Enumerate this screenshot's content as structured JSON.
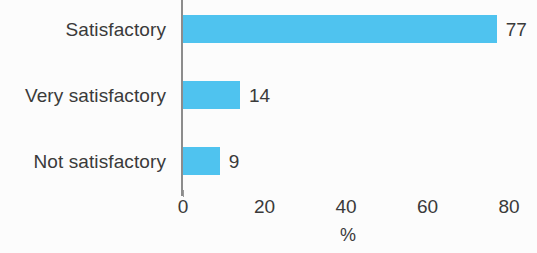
{
  "chart_data": {
    "type": "bar",
    "orientation": "horizontal",
    "title": "",
    "subtitle": "",
    "categories": [
      "Satisfactory",
      "Very satisfactory",
      "Not satisfactory"
    ],
    "values": [
      77,
      14,
      9
    ],
    "value_labels": [
      "77",
      "14",
      "9"
    ],
    "xlabel": "%",
    "ylabel": "",
    "xlim": [
      0,
      82
    ],
    "xticks": [
      0,
      20,
      40,
      60,
      80
    ],
    "xtick_labels": [
      "0",
      "20",
      "40",
      "60",
      "80"
    ],
    "grid": false,
    "legend": null,
    "bar_color": "#4fc3ef",
    "text_color": "#3a3a3a",
    "axis_color": "#8c8c8c",
    "background_color": "#fcfcfc"
  }
}
